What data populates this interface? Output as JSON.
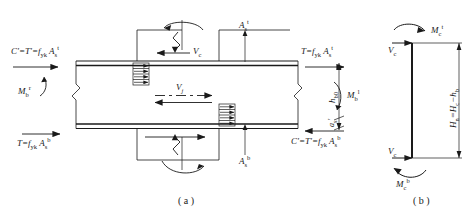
{
  "figure": {
    "type": "engineering-free-body-diagram",
    "panels": [
      {
        "id": "a",
        "caption": "( a )",
        "description": "joint core region free body"
      },
      {
        "id": "b",
        "caption": "( b )",
        "description": "column free body"
      }
    ],
    "stroke_color": "#1a1a1a",
    "background_color": "#ffffff"
  },
  "panel_a": {
    "labels": {
      "top_left_force": {
        "text": "C'=T'=f",
        "sub1": "yk",
        "mid": " A",
        "sub2": "s",
        "sup2": "t"
      },
      "bottom_left_force": {
        "text": "T=f",
        "sub1": "yk",
        "mid": " A",
        "sub2": "s",
        "sup2": "b"
      },
      "top_right_force": {
        "text": "T=f",
        "sub1": "yk",
        "mid": " A",
        "sub2": "s",
        "sup2": "t"
      },
      "bottom_right_force": {
        "text": "C'=T'=f",
        "sub1": "yk",
        "mid": " A",
        "sub2": "s",
        "sup2": "b"
      },
      "moment_left": {
        "text": "M",
        "sub": "b",
        "sup": "r"
      },
      "moment_right": {
        "text": "M",
        "sub": "b",
        "sup": "l"
      },
      "shear_top": {
        "text": "V",
        "sub": "c"
      },
      "shear_joint": {
        "text": "V",
        "sub": "j"
      },
      "rebar_top": {
        "text": "A",
        "sub": "s",
        "sup": "t"
      },
      "rebar_bottom": {
        "text": "A",
        "sub": "s",
        "sup": "b"
      },
      "depth_hb0": {
        "text": "h",
        "sub": "b0"
      },
      "cover_as": {
        "text": "a",
        "sub": "s",
        "prime": "'"
      }
    }
  },
  "panel_b": {
    "labels": {
      "moment_top": {
        "text": "M",
        "sub": "c",
        "sup": "t"
      },
      "moment_bottom": {
        "text": "M",
        "sub": "c",
        "sup": "b"
      },
      "shear_top": {
        "text": "V",
        "sub": "c"
      },
      "shear_bottom": {
        "text": "V",
        "sub": "c"
      },
      "height": {
        "text": "H",
        "sub1": "n",
        "eq": "=H",
        "sub2": "c",
        "minus": "−h",
        "sub3": "b"
      }
    }
  }
}
